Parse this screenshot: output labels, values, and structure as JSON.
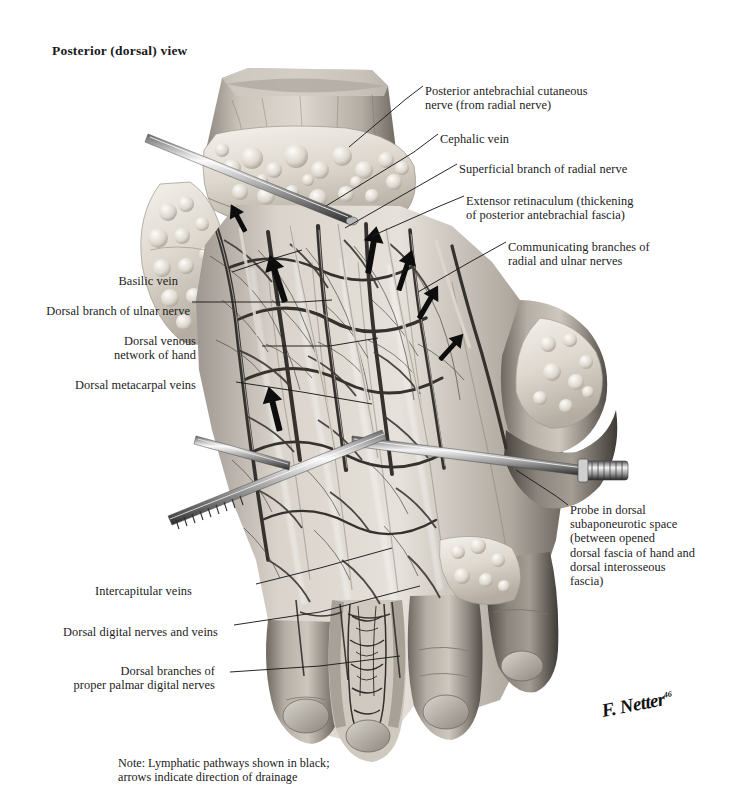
{
  "plate": {
    "title": "Posterior (dorsal) view",
    "subject": "dorsum-of-hand-dissection",
    "signature": "F. Netter",
    "signature_year": "46",
    "note_lines": [
      "Note: Lymphatic pathways shown in black;",
      "arrows indicate direction of drainage"
    ],
    "palette": {
      "background": "#ffffff",
      "ink": "#1b1b1b",
      "skin_light": "#e3dfda",
      "skin_mid": "#b9b2ab",
      "skin_dark": "#7d766f",
      "skin_deep": "#4e4942",
      "fat_light": "#efebe5",
      "fat_mid": "#cbc4bb",
      "vessel": "#3d3a36",
      "vessel_dark": "#211f1d",
      "metal_light": "#f2f2f2",
      "metal_mid": "#9a9a9a",
      "metal_dark": "#3a3a3a",
      "lymph_black": "#0d0d0d"
    }
  },
  "labels": {
    "right": [
      {
        "id": "posterior-antebrachial-cutaneous-nerve",
        "lines": [
          "Posterior antebrachial cutaneous",
          "nerve (from radial nerve)"
        ],
        "x": 425,
        "y": 84
      },
      {
        "id": "cephalic-vein",
        "lines": [
          "Cephalic vein"
        ],
        "x": 440,
        "y": 132
      },
      {
        "id": "superficial-branch-of-radial-nerve",
        "lines": [
          "Superficial branch of radial nerve"
        ],
        "x": 459,
        "y": 162
      },
      {
        "id": "extensor-retinaculum",
        "lines": [
          "Extensor retinaculum (thickening",
          "of posterior antebrachial fascia)"
        ],
        "x": 466,
        "y": 194
      },
      {
        "id": "communicating-branches-radial-ulnar",
        "lines": [
          "Communicating branches of",
          "radial and ulnar nerves"
        ],
        "x": 508,
        "y": 240
      },
      {
        "id": "probe-in-dorsal-subaponeurotic-space",
        "lines": [
          "Probe in dorsal",
          "subaponeurotic space",
          "(between opened",
          "dorsal fascia of hand and",
          "dorsal interosseous",
          "fascia)"
        ],
        "x": 570,
        "y": 503
      }
    ],
    "left": [
      {
        "id": "basilic-vein",
        "lines": [
          "Basilic vein"
        ],
        "x": 178,
        "y": 274
      },
      {
        "id": "dorsal-branch-of-ulnar-nerve",
        "lines": [
          "Dorsal branch of ulnar nerve"
        ],
        "x": 190,
        "y": 304
      },
      {
        "id": "dorsal-venous-network-of-hand",
        "lines": [
          "Dorsal venous",
          "network of hand"
        ],
        "x": 196,
        "y": 334
      },
      {
        "id": "dorsal-metacarpal-veins",
        "lines": [
          "Dorsal metacarpal veins"
        ],
        "x": 196,
        "y": 378
      },
      {
        "id": "intercapitular-veins",
        "lines": [
          "Intercapitular veins"
        ],
        "x": 192,
        "y": 584
      },
      {
        "id": "dorsal-digital-nerves-and-veins",
        "lines": [
          "Dorsal digital nerves and veins"
        ],
        "x": 218,
        "y": 625
      },
      {
        "id": "dorsal-branches-proper-palmar-digital-nerves",
        "lines": [
          "Dorsal branches of",
          "proper palmar digital nerves"
        ],
        "x": 215,
        "y": 664
      }
    ]
  },
  "note_position": {
    "x": 118,
    "y": 756
  },
  "title_position": {
    "x": 52,
    "y": 43
  }
}
